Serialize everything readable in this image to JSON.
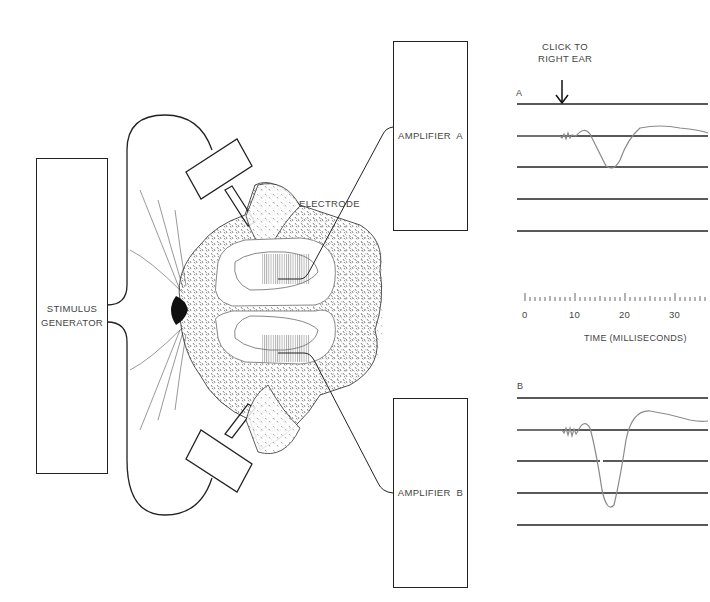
{
  "diagram": {
    "stimulus_generator": {
      "line1": "STIMULUS",
      "line2": "GENERATOR"
    },
    "amplifier_a": {
      "label": "AMPLIFIER  A"
    },
    "amplifier_b": {
      "label": "AMPLIFIER  B"
    },
    "electrode_label": "ELECTRODE",
    "stimulus_annotation": {
      "line1": "CLICK TO",
      "line2": "RIGHT EAR"
    },
    "trace_a_label": "A",
    "trace_b_label": "B",
    "time_axis": {
      "ticks": [
        "0",
        "10",
        "20",
        "30"
      ],
      "label": "TIME (MILLISECONDS)"
    },
    "colors": {
      "line": "#222222",
      "trace": "#8a8a8a",
      "fur": "#1a1a1a",
      "cortex_outline": "#888888",
      "response_area": "#9a9a9a"
    }
  }
}
